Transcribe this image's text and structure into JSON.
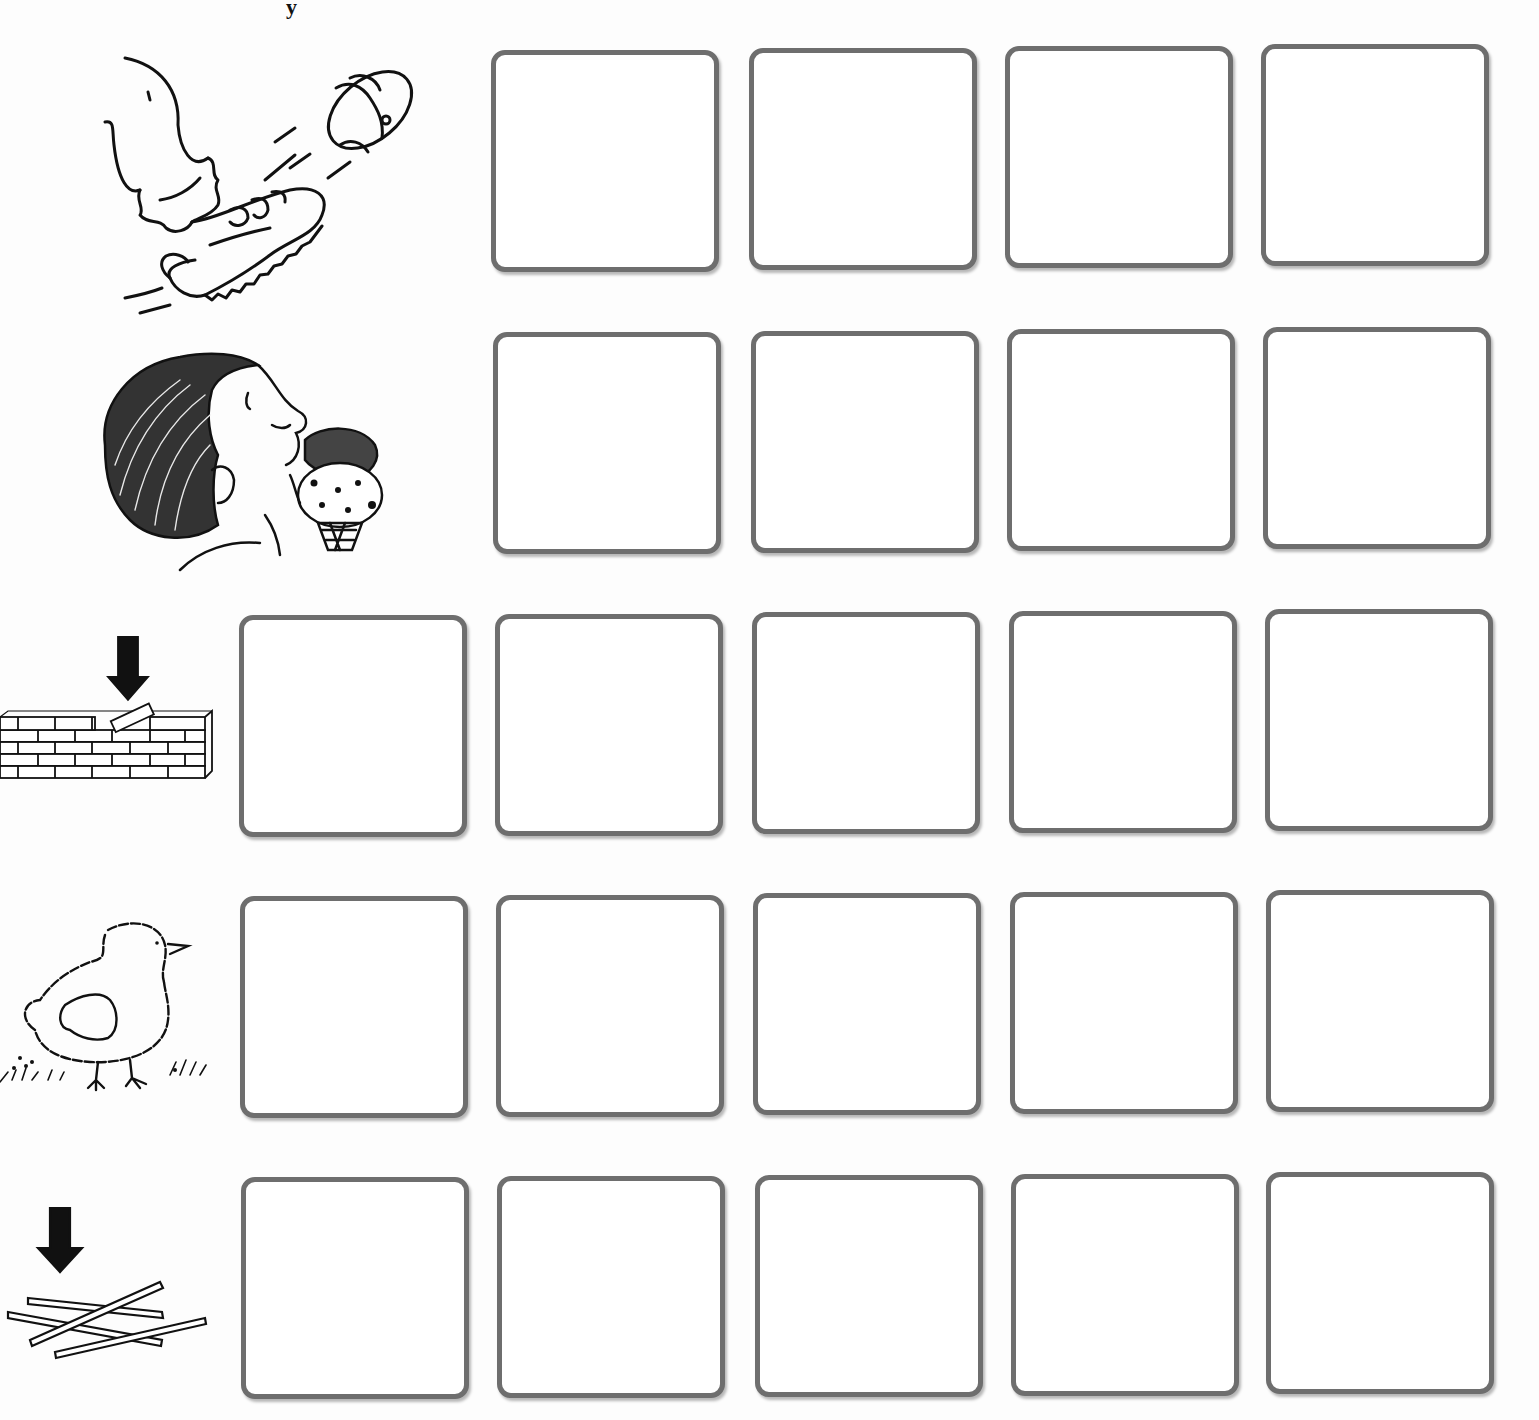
{
  "worksheet": {
    "top_fragment": "y",
    "colors": {
      "box_border": "#6e6e6e",
      "line_art": "#111111",
      "background": "#fdfdfd"
    },
    "rows": [
      {
        "id": "kick",
        "picture": "foot-kicking-football-icon",
        "has_arrow": false,
        "letter_boxes": 4
      },
      {
        "id": "lick",
        "picture": "boy-licking-ice-cream-icon",
        "has_arrow": false,
        "letter_boxes": 4
      },
      {
        "id": "brick",
        "picture": "brick-wall-with-arrow-icon",
        "has_arrow": true,
        "letter_boxes": 5
      },
      {
        "id": "chick",
        "picture": "baby-chick-icon",
        "has_arrow": false,
        "letter_boxes": 5
      },
      {
        "id": "stick",
        "picture": "sticks-with-arrow-icon",
        "has_arrow": true,
        "letter_boxes": 5
      }
    ]
  }
}
